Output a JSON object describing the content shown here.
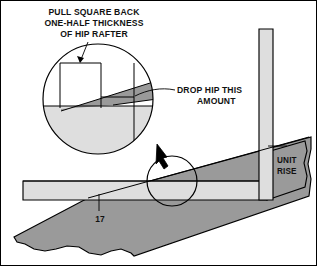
{
  "diagram": {
    "colors": {
      "light_fill": "#DEDEDE",
      "dark_fill": "#9A9A9A",
      "outline": "#000000",
      "background": "#FFFFFF",
      "text": "#111111"
    },
    "labels": {
      "pull_square_line1": "PULL SQUARE BACK",
      "pull_square_line2": "ONE-HALF THICKNESS",
      "pull_square_line3": "OF HIP RAFTER",
      "drop_hip_line1": "DROP HIP THIS",
      "drop_hip_line2": "AMOUNT",
      "unit_rise_line1": "UNIT",
      "unit_rise_line2": "RISE",
      "unit_run": "17"
    },
    "annotations": {
      "magnifier_label": "magnified-detail-circle",
      "callout_label": "detail-location-circle",
      "arrow_label": "callout-arrow"
    }
  }
}
